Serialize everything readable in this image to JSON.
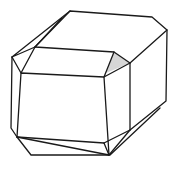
{
  "figure": {
    "colors": {
      "line": "#1a1a1a",
      "background": "#ffffff",
      "shade": "#cfcfcf"
    }
  }
}
